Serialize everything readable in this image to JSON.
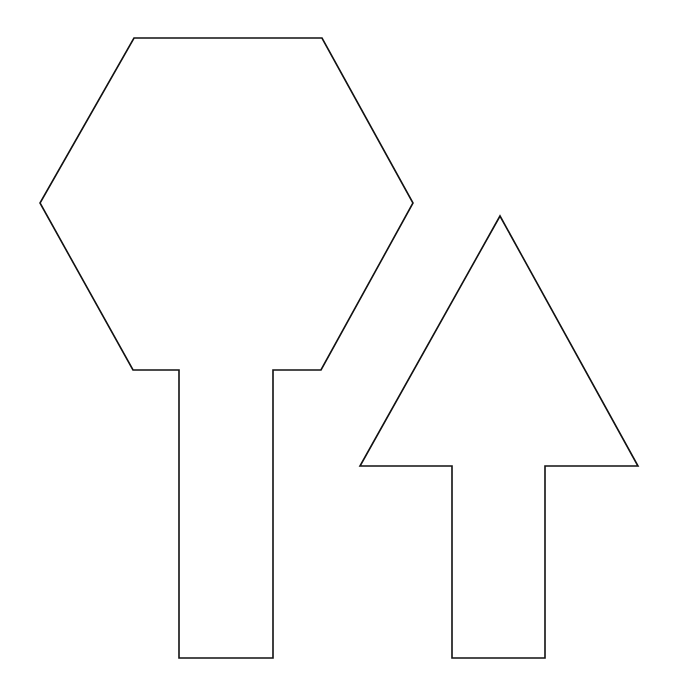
{
  "canvas": {
    "width": 675,
    "height": 700,
    "background": "#ffffff"
  },
  "stroke_color": "#111111",
  "shapes": [
    {
      "name": "hexagon-on-stem",
      "points": "134,38 322,38 413,203 321,370 273,370 273,658 179,658 179,370 133,370 40,203"
    },
    {
      "name": "up-arrow",
      "points": "500,216 638,466 545,466 545,658 452,658 452,466 360,466"
    }
  ]
}
